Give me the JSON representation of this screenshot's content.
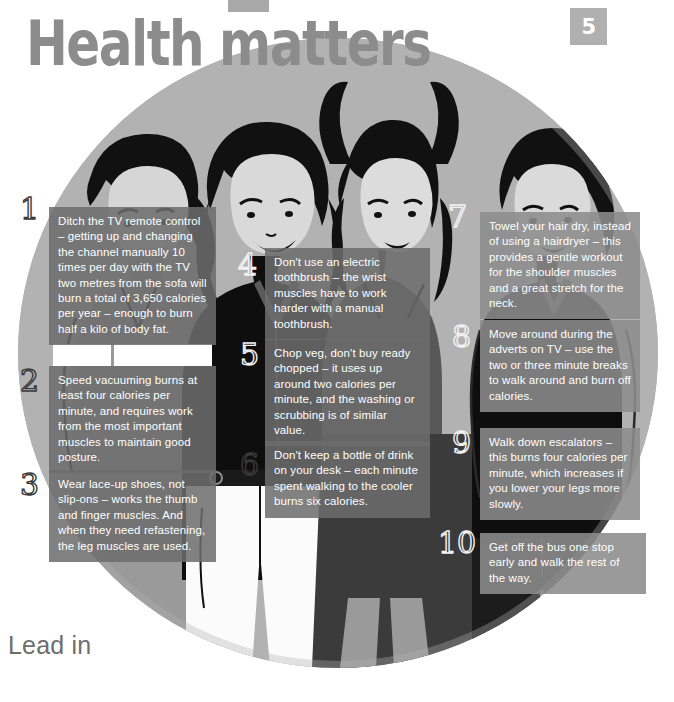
{
  "page": {
    "title": "Health matters",
    "badge_number": "5",
    "footer_heading": "Lead in",
    "colors": {
      "heading_gray": "#8c8c8c",
      "badge_gray": "#b0b0b0",
      "circle_gray": "#b2b2b2",
      "tip_box_gray": "#6c6c6c",
      "tip_text": "#ffffff",
      "ink_black": "#111111"
    }
  },
  "tips": [
    {
      "number": "1",
      "text": "Ditch the TV remote control – getting up and changing the channel manually 10 times per day with the TV two metres from the sofa will burn a total of 3,650 calories per year – enough to burn half a kilo of body fat."
    },
    {
      "number": "2",
      "text": "Speed vacuuming burns at least four calories per minute, and requires work from the most important muscles to maintain good posture."
    },
    {
      "number": "3",
      "text": "Wear lace-up shoes, not slip-ons – works the thumb and finger muscles. And when they need refastening, the leg muscles are used."
    },
    {
      "number": "4",
      "text": "Don't use an electric toothbrush – the wrist muscles have to work harder with a manual toothbrush."
    },
    {
      "number": "5",
      "text": "Chop veg, don't buy ready chopped – it uses up around two calories per minute, and the washing or scrubbing is of similar value."
    },
    {
      "number": "6",
      "text": "Don't keep a bottle of drink on your desk – each minute spent walking to the cooler burns six calories."
    },
    {
      "number": "7",
      "text": "Towel your hair dry, instead of using a hairdryer – this provides a gentle workout for the shoulder muscles and a great stretch for the neck."
    },
    {
      "number": "8",
      "text": "Move around during the adverts on TV – use the two or three minute breaks to walk around and burn off calories."
    },
    {
      "number": "9",
      "text": "Walk down escalators – this burns four calories per minute, which increases if you lower your legs more slowly."
    },
    {
      "number": "10",
      "text": "Get off the bus one stop early and walk the rest of the way."
    }
  ]
}
